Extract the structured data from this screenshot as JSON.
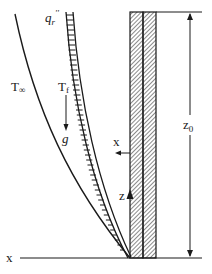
{
  "diagram": {
    "type": "boundary-layer-fire-wall-schematic",
    "colors": {
      "line": "#1a1a1a",
      "background": "#ffffff",
      "hatch": "#2a2a2a"
    },
    "labels": {
      "ambient_temp_main": "T",
      "ambient_temp_sub": "∞",
      "flame_temp_main": "T",
      "flame_temp_sub": "f",
      "gravity": "g",
      "radiant_flux_main": "q",
      "radiant_flux_sub": "r",
      "radiant_flux_sup": "''",
      "x_axis_label": "x",
      "x_arrow_label": "x",
      "z_arrow_label": "z",
      "height_main": "z",
      "height_sub": "0"
    },
    "elements": [
      {
        "id": "wall",
        "description": "Two-layer hatched vertical wall"
      },
      {
        "id": "ambient-curve",
        "description": "Outer curve labeled T∞"
      },
      {
        "id": "flame-sheet",
        "description": "Ladder-hatched band labeled q_r''"
      },
      {
        "id": "gravity-arrow",
        "description": "Downward arrow labeled g"
      },
      {
        "id": "x-direction-arrow",
        "description": "Leftward arrow labeled x"
      },
      {
        "id": "z-direction-arrow",
        "description": "Upward arrow labeled z"
      },
      {
        "id": "height-dimension",
        "description": "Double-headed vertical dimension labeled z0"
      },
      {
        "id": "baseline",
        "description": "Horizontal ground line labeled x"
      }
    ]
  }
}
